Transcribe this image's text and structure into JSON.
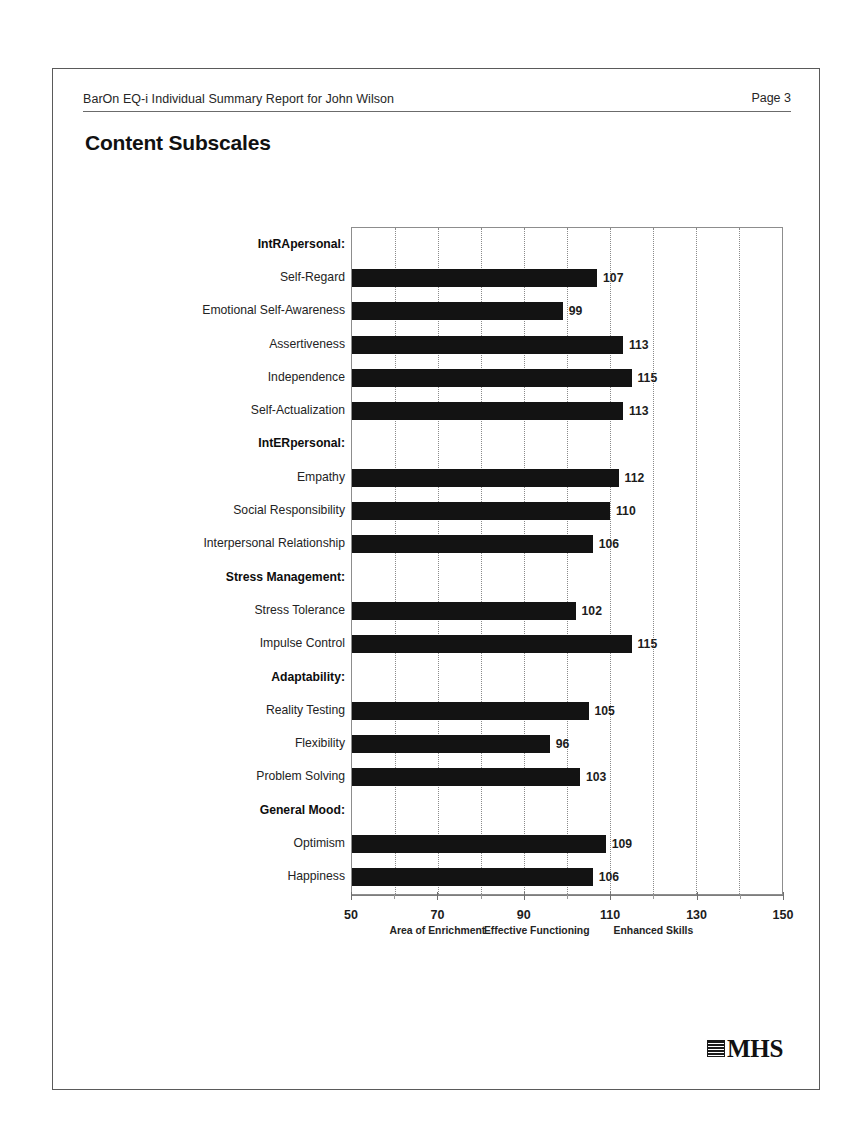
{
  "header": {
    "title": "BarOn EQ-i Individual Summary Report for John Wilson",
    "page_label": "Page 3"
  },
  "section": {
    "title": "Content Subscales"
  },
  "logo": {
    "text": "MHS",
    "mark_name": "mhs-logo-mark"
  },
  "chart_data": {
    "type": "bar",
    "orientation": "horizontal",
    "title": "Content Subscales",
    "xlabel": "",
    "ylabel": "",
    "xlim": [
      50,
      150
    ],
    "grid": "vertical-dotted-every-10",
    "legend": "none",
    "tick_labels": [
      "50",
      "70",
      "90",
      "110",
      "130",
      "150"
    ],
    "tick_values": [
      50,
      70,
      90,
      110,
      130,
      150
    ],
    "minor_tick_values": [
      60,
      80,
      100,
      120,
      140
    ],
    "gridline_values": [
      60,
      70,
      80,
      90,
      100,
      110,
      120,
      130,
      140
    ],
    "zone_labels": [
      {
        "text": "Area of Enrichment",
        "center": 70
      },
      {
        "text": "Effective Functioning",
        "center": 93
      },
      {
        "text": "Enhanced Skills",
        "center": 120
      }
    ],
    "rows": [
      {
        "label": "IntRApersonal:",
        "group": true,
        "value": null
      },
      {
        "label": "Self-Regard",
        "group": false,
        "value": 107
      },
      {
        "label": "Emotional Self-Awareness",
        "group": false,
        "value": 99
      },
      {
        "label": "Assertiveness",
        "group": false,
        "value": 113
      },
      {
        "label": "Independence",
        "group": false,
        "value": 115
      },
      {
        "label": "Self-Actualization",
        "group": false,
        "value": 113
      },
      {
        "label": "IntERpersonal:",
        "group": true,
        "value": null
      },
      {
        "label": "Empathy",
        "group": false,
        "value": 112
      },
      {
        "label": "Social Responsibility",
        "group": false,
        "value": 110
      },
      {
        "label": "Interpersonal Relationship",
        "group": false,
        "value": 106
      },
      {
        "label": "Stress Management:",
        "group": true,
        "value": null
      },
      {
        "label": "Stress Tolerance",
        "group": false,
        "value": 102
      },
      {
        "label": "Impulse Control",
        "group": false,
        "value": 115
      },
      {
        "label": "Adaptability:",
        "group": true,
        "value": null
      },
      {
        "label": "Reality Testing",
        "group": false,
        "value": 105
      },
      {
        "label": "Flexibility",
        "group": false,
        "value": 96
      },
      {
        "label": "Problem Solving",
        "group": false,
        "value": 103
      },
      {
        "label": "General Mood:",
        "group": true,
        "value": null
      },
      {
        "label": "Optimism",
        "group": false,
        "value": 109
      },
      {
        "label": "Happiness",
        "group": false,
        "value": 106
      }
    ],
    "categories": [
      "Self-Regard",
      "Emotional Self-Awareness",
      "Assertiveness",
      "Independence",
      "Self-Actualization",
      "Empathy",
      "Social Responsibility",
      "Interpersonal Relationship",
      "Stress Tolerance",
      "Impulse Control",
      "Reality Testing",
      "Flexibility",
      "Problem Solving",
      "Optimism",
      "Happiness"
    ],
    "values": [
      107,
      99,
      113,
      115,
      113,
      112,
      110,
      106,
      102,
      115,
      105,
      96,
      103,
      109,
      106
    ],
    "colors": {
      "bar": "#131313",
      "grid": "#8a8a8a",
      "axis": "#7d7d7d"
    }
  }
}
